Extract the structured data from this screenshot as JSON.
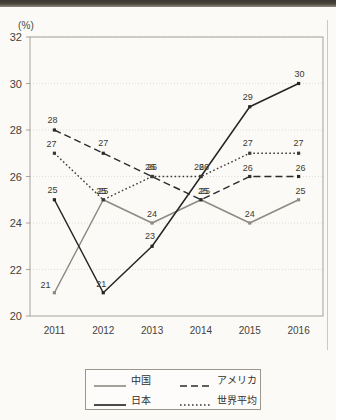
{
  "chart_data": {
    "type": "line",
    "title": "",
    "xlabel": "",
    "ylabel": "(%)",
    "unit_label": "(%)",
    "categories": [
      "2011",
      "2012",
      "2013",
      "2014",
      "2015",
      "2016"
    ],
    "ylim": [
      20,
      32
    ],
    "yticks": [
      20,
      22,
      24,
      26,
      28,
      30,
      32
    ],
    "grid": "horizontal-dotted",
    "legend_position": "bottom-center",
    "series": [
      {
        "name": "中国",
        "style": "solid",
        "color": "#8d8a82",
        "values": [
          21,
          25,
          24,
          25,
          24,
          25
        ],
        "labels": [
          "21",
          "25",
          "24",
          "25",
          "24",
          "25"
        ]
      },
      {
        "name": "日本",
        "style": "solid",
        "color": "#252525",
        "values": [
          25,
          21,
          23,
          26,
          29,
          30
        ],
        "labels": [
          "25",
          "21",
          "23",
          "26",
          "29",
          "30"
        ]
      },
      {
        "name": "アメリカ",
        "style": "dashed",
        "color": "#2b2b2b",
        "values": [
          28,
          27,
          26,
          25,
          26,
          26
        ],
        "labels": [
          "28",
          "27",
          "26",
          "25",
          "26",
          "26"
        ]
      },
      {
        "name": "世界平均",
        "style": "dotted",
        "color": "#3a3a3a",
        "values": [
          27,
          25,
          26,
          26,
          27,
          27
        ],
        "labels": [
          "27",
          "25",
          "26",
          "26",
          "27",
          "27"
        ]
      }
    ]
  },
  "axis": {
    "y_unit": "(%)",
    "y_labels": [
      "32",
      "30",
      "28",
      "26",
      "24",
      "22",
      "20"
    ],
    "x_labels": [
      "2011",
      "2012",
      "2013",
      "2014",
      "2015",
      "2016"
    ]
  },
  "legend": {
    "entries": [
      {
        "label": "中国",
        "style": "solid",
        "color": "#8d8a82"
      },
      {
        "label": "アメリカ",
        "style": "dashed",
        "color": "#2b2b2b"
      },
      {
        "label": "日本",
        "style": "solid",
        "color": "#1d1d1d"
      },
      {
        "label": "世界平均",
        "style": "dotted",
        "color": "#3a3a3a"
      }
    ]
  }
}
